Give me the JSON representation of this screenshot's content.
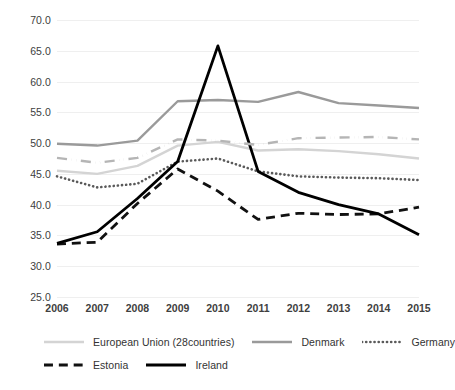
{
  "chart_data": {
    "type": "line",
    "title": "",
    "subtitle": "",
    "xlabel": "",
    "ylabel": "",
    "categories": [
      "2006",
      "2007",
      "2008",
      "2009",
      "2010",
      "2011",
      "2012",
      "2013",
      "2014",
      "2015"
    ],
    "x": [
      2006,
      2007,
      2008,
      2009,
      2010,
      2011,
      2012,
      2013,
      2014,
      2015
    ],
    "xlim": [
      2006,
      2015
    ],
    "ylim": [
      25.0,
      70.0
    ],
    "yticks": [
      "70.0",
      "65.0",
      "60.0",
      "55.0",
      "50.0",
      "45.0",
      "40.0",
      "35.0",
      "30.0",
      "25.0"
    ],
    "ytick_values": [
      70.0,
      65.0,
      60.0,
      55.0,
      50.0,
      45.0,
      40.0,
      35.0,
      30.0,
      25.0
    ],
    "grid": true,
    "grid_axis": "y",
    "legend_position": "bottom",
    "series": [
      {
        "name": "European Union (28countries)",
        "style": "solid",
        "color": "#d4d4d4",
        "width": 2.4,
        "values": [
          45.5,
          45.0,
          46.3,
          49.6,
          50.2,
          48.8,
          49.0,
          48.7,
          48.2,
          47.5
        ]
      },
      {
        "name": "Denmark",
        "style": "solid",
        "color": "#9a9a9a",
        "width": 2.4,
        "values": [
          49.9,
          49.6,
          50.4,
          56.8,
          57.0,
          56.7,
          58.3,
          56.5,
          56.1,
          55.7
        ]
      },
      {
        "name": "Germany",
        "style": "dotted",
        "color": "#5a5a5a",
        "width": 2.6,
        "values": [
          44.6,
          42.8,
          43.4,
          47.0,
          47.5,
          45.4,
          44.6,
          44.4,
          44.3,
          44.0
        ]
      },
      {
        "name": "Estonia",
        "style": "dashed",
        "color": "#111111",
        "width": 2.8,
        "values": [
          33.6,
          33.9,
          40.2,
          45.8,
          42.2,
          37.6,
          38.6,
          38.4,
          38.5,
          39.6
        ]
      },
      {
        "name": "Ireland",
        "style": "solid",
        "color": "#000000",
        "width": 2.8,
        "values": [
          33.7,
          35.6,
          41.0,
          47.0,
          65.8,
          45.4,
          42.0,
          40.0,
          38.5,
          35.1
        ]
      },
      {
        "name": "",
        "style": "dashdot",
        "color": "#b5b5b5",
        "width": 2.4,
        "legend_hidden": true,
        "values": [
          47.6,
          46.8,
          47.6,
          50.6,
          50.4,
          49.7,
          50.8,
          50.9,
          51.0,
          50.6
        ]
      }
    ]
  },
  "legend": {
    "rows": [
      [
        {
          "label": "European Union (28countries)",
          "series_index": 0
        },
        {
          "label": "Denmark",
          "series_index": 1
        },
        {
          "label": "Germany",
          "series_index": 2
        }
      ],
      [
        {
          "label": "Estonia",
          "series_index": 3
        },
        {
          "label": "Ireland",
          "series_index": 4
        }
      ]
    ]
  }
}
